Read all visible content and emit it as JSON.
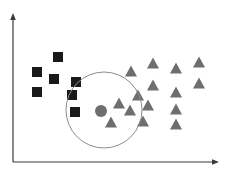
{
  "figure": {
    "title": "",
    "background_color": "#ffffff"
  },
  "axes": {
    "x_axis": {
      "label": "",
      "color": "#3a3a3a",
      "x_start": 13,
      "x_end": 219,
      "y": 162,
      "arrow": true,
      "ticks": []
    },
    "y_axis": {
      "label": "",
      "color": "#3a3a3a",
      "x": 13,
      "y_start": 162,
      "y_end": 14,
      "arrow": true,
      "ticks": []
    }
  },
  "legend": {
    "visible": false,
    "entries": []
  },
  "chart_data": {
    "type": "scatter",
    "title": "",
    "xlabel": "",
    "ylabel": "",
    "xlim": [
      13,
      219
    ],
    "ylim": [
      162,
      14
    ],
    "grid": false,
    "legend_position": "none",
    "series": [
      {
        "name": "Class A",
        "marker": "square",
        "color": "#1a1a1a",
        "marker_size": 10,
        "points": [
          {
            "x": 58,
            "y": 57
          },
          {
            "x": 37,
            "y": 72
          },
          {
            "x": 54,
            "y": 79
          },
          {
            "x": 37,
            "y": 92
          },
          {
            "x": 76,
            "y": 82
          },
          {
            "x": 72,
            "y": 95
          },
          {
            "x": 75,
            "y": 112
          }
        ]
      },
      {
        "name": "Class B",
        "marker": "triangle",
        "color": "#6e6e6e",
        "marker_size": 12,
        "points": [
          {
            "x": 119,
            "y": 103
          },
          {
            "x": 111,
            "y": 122
          },
          {
            "x": 131,
            "y": 71
          },
          {
            "x": 153,
            "y": 63
          },
          {
            "x": 176,
            "y": 68
          },
          {
            "x": 199,
            "y": 62
          },
          {
            "x": 153,
            "y": 85
          },
          {
            "x": 199,
            "y": 83
          },
          {
            "x": 138,
            "y": 95
          },
          {
            "x": 176,
            "y": 92
          },
          {
            "x": 130,
            "y": 110
          },
          {
            "x": 148,
            "y": 105
          },
          {
            "x": 176,
            "y": 109
          },
          {
            "x": 143,
            "y": 121
          },
          {
            "x": 176,
            "y": 124
          }
        ]
      }
    ],
    "annotations": [
      {
        "kind": "circle",
        "name": "cluster-boundary",
        "cx": 104,
        "cy": 110,
        "r": 38,
        "stroke": "#8c8c8c",
        "stroke_width": 1,
        "fill": "none"
      },
      {
        "kind": "point",
        "name": "cluster-centroid",
        "marker": "circle",
        "cx": 101,
        "cy": 111,
        "r": 6,
        "color": "#6e6e6e"
      }
    ]
  }
}
